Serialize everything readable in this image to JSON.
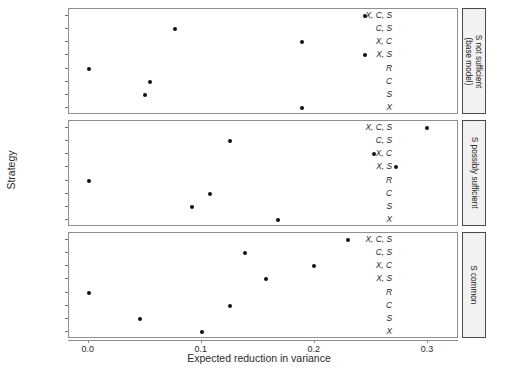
{
  "chart_data": {
    "type": "scatter",
    "title": "",
    "xlabel": "Expected reduction in variance",
    "ylabel": "Strategy",
    "xlim": [
      -0.0175,
      0.3275
    ],
    "xticks": [
      0.0,
      0.1,
      0.2,
      0.3
    ],
    "xticklabels": [
      "0.0",
      "0.1",
      "0.2",
      "0.3"
    ],
    "categories": [
      "X, C, S",
      "C, S",
      "X, C",
      "X, S",
      "R",
      "C",
      "S",
      "X"
    ],
    "grid": false,
    "legend": false,
    "facet_direction": "vertical",
    "facet_strip_position": "right",
    "panels": [
      {
        "strip_label": "S not sufficient (base model)",
        "strip_label_lines": [
          "S not sufficient",
          "(base model)"
        ],
        "points": [
          {
            "strategy": "X, C, S",
            "value": 0.244
          },
          {
            "strategy": "C, S",
            "value": 0.076
          },
          {
            "strategy": "X, C",
            "value": 0.189
          },
          {
            "strategy": "X, S",
            "value": 0.244
          },
          {
            "strategy": "R",
            "value": 0.0
          },
          {
            "strategy": "C",
            "value": 0.054
          },
          {
            "strategy": "S",
            "value": 0.05
          },
          {
            "strategy": "X",
            "value": 0.189
          }
        ]
      },
      {
        "strip_label": "S possibly sufficient",
        "strip_label_lines": [
          "S possibly sufficient"
        ],
        "points": [
          {
            "strategy": "X, C, S",
            "value": 0.299
          },
          {
            "strategy": "C, S",
            "value": 0.125
          },
          {
            "strategy": "X, C",
            "value": 0.252
          },
          {
            "strategy": "X, S",
            "value": 0.272
          },
          {
            "strategy": "R",
            "value": 0.0
          },
          {
            "strategy": "C",
            "value": 0.107
          },
          {
            "strategy": "S",
            "value": 0.091
          },
          {
            "strategy": "X",
            "value": 0.167
          }
        ]
      },
      {
        "strip_label": "S common",
        "strip_label_lines": [
          "S common"
        ],
        "points": [
          {
            "strategy": "X, C, S",
            "value": 0.229
          },
          {
            "strategy": "C, S",
            "value": 0.138
          },
          {
            "strategy": "X, C",
            "value": 0.199
          },
          {
            "strategy": "X, S",
            "value": 0.157
          },
          {
            "strategy": "R",
            "value": 0.0
          },
          {
            "strategy": "C",
            "value": 0.125
          },
          {
            "strategy": "S",
            "value": 0.045
          },
          {
            "strategy": "X",
            "value": 0.1
          }
        ]
      }
    ]
  }
}
